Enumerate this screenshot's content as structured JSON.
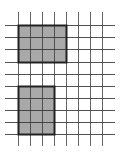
{
  "diagram": {
    "title": "",
    "grid": {
      "vertical_lines_x": [
        18,
        30,
        42,
        54,
        66,
        78,
        90,
        102
      ],
      "vertical_span_y": [
        12,
        146
      ],
      "horizontal_lines_y": [
        25,
        37,
        49,
        62,
        74,
        86,
        98,
        110,
        122,
        134
      ],
      "horizontal_span_x": [
        5,
        115
      ],
      "cell_size": 12,
      "line_color": "#333333",
      "line_width": 1
    },
    "shapes": [
      {
        "name": "rectangle-top",
        "x": 18,
        "y": 25,
        "width": 48,
        "height": 37,
        "cols": 4,
        "rows": 3,
        "fill": "#a9a9a9",
        "stroke": "#222222",
        "stroke_width": 2
      },
      {
        "name": "rectangle-bottom",
        "x": 18,
        "y": 86,
        "width": 36,
        "height": 48,
        "cols": 3,
        "rows": 4,
        "fill": "#a9a9a9",
        "stroke": "#222222",
        "stroke_width": 2
      }
    ]
  }
}
